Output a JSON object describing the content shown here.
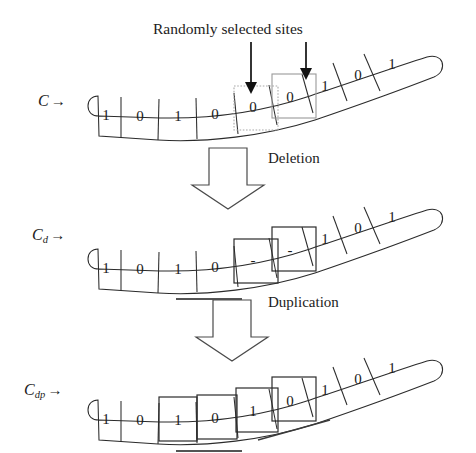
{
  "figure": {
    "title": "Randomly selected sites",
    "background_color": "#ffffff",
    "ink_color": "#1c1c1c",
    "highlight_color": "#9a9a9a",
    "box_color": "#2b2b2b"
  },
  "annotations": {
    "randomly_selected_sites": "Randomly selected sites",
    "deletion": "Deletion",
    "duplication": "Duplication"
  },
  "rows": [
    {
      "id": "c",
      "label_base": "C",
      "label_sub": "",
      "label_arrow": "→",
      "cells": [
        "1",
        "0",
        "1",
        "0",
        "0",
        "0",
        "1",
        "0",
        "1"
      ],
      "selected_indices": [
        4,
        5
      ],
      "selection_style": "gray",
      "underlines": []
    },
    {
      "id": "cd",
      "label_base": "C",
      "label_sub": "d",
      "label_arrow": "→",
      "cells": [
        "1",
        "0",
        "1",
        "0",
        "-",
        "-",
        "1",
        "0",
        "1"
      ],
      "selected_indices": [
        4,
        5
      ],
      "selection_style": "black",
      "underlines": [
        "segment-2-3"
      ]
    },
    {
      "id": "cdp",
      "label_base": "C",
      "label_sub": "dp",
      "label_arrow": "→",
      "cells": [
        "1",
        "0",
        "1",
        "0",
        "1",
        "0",
        "1",
        "0",
        "1"
      ],
      "selected_indices": [
        2,
        3,
        4,
        5
      ],
      "selection_style": "black",
      "underlines": [
        "segment-2-3",
        "segment-4-5"
      ]
    }
  ],
  "operations": [
    {
      "id": "deletion",
      "label": "Deletion",
      "arrow": "block-down-arrow"
    },
    {
      "id": "duplication",
      "label": "Duplication",
      "arrow": "block-down-arrow"
    }
  ],
  "site_arrows": [
    {
      "id": "site-arrow-left",
      "target_cell_index": 4
    },
    {
      "id": "site-arrow-right",
      "target_cell_index": 5
    }
  ]
}
